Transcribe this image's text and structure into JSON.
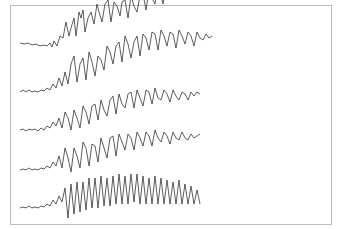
{
  "figure": {
    "channels": 5,
    "stroke_color": "#333333",
    "border_color": "#bdbdbd"
  }
}
